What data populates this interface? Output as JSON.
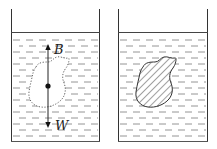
{
  "diagram": {
    "left_container": {
      "object_style": "dotted outline",
      "forces": [
        {
          "label": "B",
          "direction": "up"
        },
        {
          "label": "W",
          "direction": "down"
        }
      ],
      "center_marker": "dot"
    },
    "right_container": {
      "object_style": "hatched solid"
    },
    "colors": {
      "line": "#333333",
      "water_dash": "#777777",
      "background": "#ffffff"
    }
  }
}
